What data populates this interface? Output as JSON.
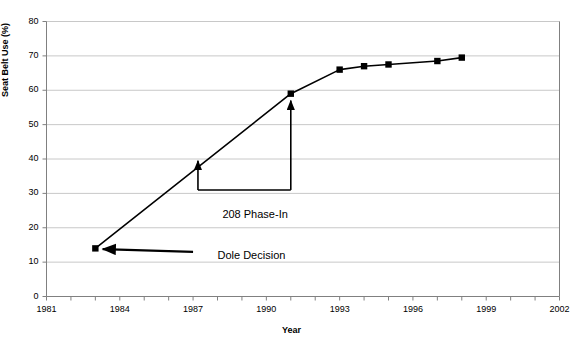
{
  "chart_data": {
    "type": "line",
    "title": "",
    "xlabel": "Year",
    "ylabel": "Seat Belt Use (%)",
    "xlim": [
      1981,
      2002
    ],
    "ylim": [
      0,
      80
    ],
    "grid": true,
    "legend": "none",
    "x_tick_labels": [
      "1981",
      "1984",
      "1987",
      "1990",
      "1993",
      "1996",
      "1999",
      "2002"
    ],
    "x_tick_values": [
      1981,
      1984,
      1987,
      1990,
      1993,
      1996,
      1999,
      2002
    ],
    "x_minor_tick_step": 1,
    "y_tick_labels": [
      "0",
      "10",
      "20",
      "30",
      "40",
      "50",
      "60",
      "70",
      "80"
    ],
    "y_tick_values": [
      0,
      10,
      20,
      30,
      40,
      50,
      60,
      70,
      80
    ],
    "series": [
      {
        "name": "Seat Belt Use",
        "marker": "square",
        "color": "#000000",
        "x": [
          1983,
          1991,
          1993,
          1994,
          1995,
          1997,
          1998
        ],
        "values": [
          14,
          59,
          66,
          67,
          67.5,
          68.5,
          69.5
        ]
      }
    ],
    "annotations": [
      {
        "id": "dole-decision",
        "text": "Dole Decision",
        "text_x": 1988.0,
        "text_y": 11.5,
        "arrow_from_x": 1987.0,
        "arrow_from_y": 13.0,
        "arrow_to_x": 1983.3,
        "arrow_to_y": 13.8
      },
      {
        "id": "phase-in",
        "text": "208 Phase-In",
        "text_x": 1988.2,
        "text_y": 23.5,
        "bracket_left_x": 1987.2,
        "bracket_right_x": 1991.0,
        "bracket_y": 31.0,
        "left_arrow_top_y": 39.5,
        "right_arrow_top_y": 57.0
      }
    ]
  },
  "colors": {
    "series": "#000000",
    "grid": "#c8c8c8",
    "axis": "#808080",
    "text": "#000000",
    "background": "#ffffff"
  }
}
